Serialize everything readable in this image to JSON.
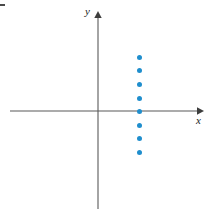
{
  "figure": {
    "width": 209,
    "height": 209,
    "background_color": "#ffffff",
    "axis_color": "#595959",
    "point_color": "#1f8ecd",
    "label_color": "#1a1a1a"
  },
  "axes": {
    "x_label": "x",
    "y_label": "y",
    "origin_px": {
      "x": 98,
      "y": 111
    },
    "x_axis_span_px": {
      "start": 10,
      "end": 201
    },
    "y_axis_span_px": {
      "start": 14,
      "end": 209
    },
    "x_arrow": "right-arrowhead",
    "y_arrow": "up-arrowhead",
    "grid": false,
    "tick_labels": []
  },
  "chart_data": {
    "type": "scatter",
    "title": "",
    "subtitle": "",
    "xlabel": "x",
    "ylabel": "y",
    "grid": false,
    "legend": null,
    "axis_arrows": true,
    "series": [
      {
        "name": "points",
        "color": "#1f8ecd",
        "marker": "filled-circle",
        "points_px": [
          {
            "x": 139,
            "y": 57
          },
          {
            "x": 139,
            "y": 70
          },
          {
            "x": 139,
            "y": 84
          },
          {
            "x": 139,
            "y": 98
          },
          {
            "x": 139,
            "y": 111
          },
          {
            "x": 139,
            "y": 125
          },
          {
            "x": 139,
            "y": 138
          },
          {
            "x": 139,
            "y": 152
          }
        ],
        "x": [
          2,
          2,
          2,
          2,
          2,
          2,
          2,
          2
        ],
        "values": [
          4,
          3,
          2,
          1,
          0,
          -1,
          -2,
          -3
        ]
      }
    ],
    "xlim": [
      -4.5,
      4
    ],
    "ylim": [
      -4.5,
      5
    ]
  },
  "marks": {
    "corner_mark": "crop-registration-mark"
  }
}
